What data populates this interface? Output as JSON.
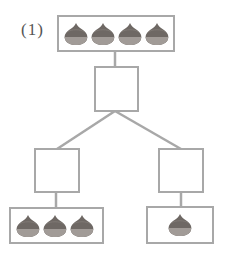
{
  "problem": {
    "label": "(1)"
  },
  "diagram": {
    "type": "number-bond",
    "top": {
      "chestnut_count": 4,
      "icon": "chestnut-icon"
    },
    "middle_blank": {
      "value": ""
    },
    "left_blank": {
      "value": ""
    },
    "right_blank": {
      "value": ""
    },
    "bottom_left": {
      "chestnut_count": 3,
      "icon": "chestnut-icon"
    },
    "bottom_right": {
      "chestnut_count": 1,
      "icon": "chestnut-icon"
    }
  },
  "colors": {
    "line": "#a8a8a8",
    "chestnut_top": "#6e6864",
    "chestnut_bottom": "#a19b97"
  }
}
